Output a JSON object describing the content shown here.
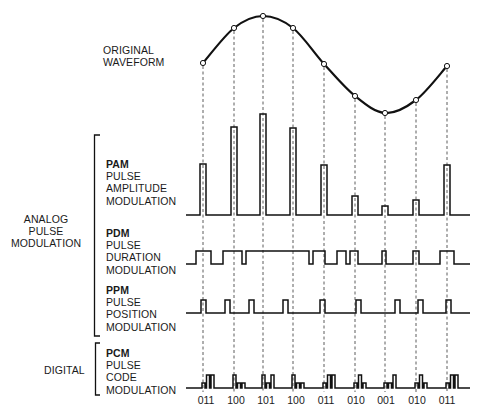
{
  "diagram": {
    "title_label": [
      "ORIGINAL",
      "WAVEFORM"
    ],
    "groups": [
      {
        "label": [
          "ANALOG",
          "PULSE",
          "MODULATION"
        ]
      },
      {
        "label": [
          "DIGITAL"
        ]
      }
    ],
    "rows": [
      {
        "abbr": "PAM",
        "lines": [
          "PULSE",
          "AMPLITUDE",
          "MODULATION"
        ]
      },
      {
        "abbr": "PDM",
        "lines": [
          "PULSE",
          "DURATION",
          "MODULATION"
        ]
      },
      {
        "abbr": "PPM",
        "lines": [
          "PULSE",
          "POSITION",
          "MODULATION"
        ]
      },
      {
        "abbr": "PCM",
        "lines": [
          "PULSE",
          "CODE",
          "MODULATION"
        ]
      }
    ],
    "sample_x": [
      203,
      234,
      263,
      293,
      324,
      355,
      385,
      416,
      447
    ],
    "sample_y": [
      63,
      28,
      16,
      28,
      64,
      96,
      113,
      100,
      66
    ],
    "pam_tops": [
      164,
      127,
      114,
      128,
      165,
      196,
      206,
      200,
      165
    ],
    "pcm_codes": [
      "011",
      "100",
      "101",
      "100",
      "011",
      "010",
      "001",
      "010",
      "011"
    ],
    "line_color": "#1a1a1a"
  }
}
